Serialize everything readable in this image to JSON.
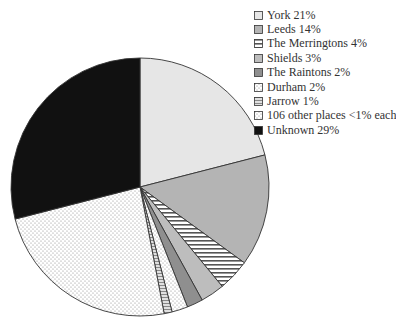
{
  "chart_data": {
    "type": "pie",
    "title": "",
    "start_angle_deg": 0,
    "direction": "clockwise",
    "slices": [
      {
        "label": "York",
        "value": 21,
        "legend": "York 21%",
        "fill": "#e6e6e6",
        "pattern": "solid"
      },
      {
        "label": "Leeds",
        "value": 14,
        "legend": "Leeds 14%",
        "fill": "#b4b4b4",
        "pattern": "solid"
      },
      {
        "label": "The Merringtons",
        "value": 4,
        "legend": "The Merringtons 4%",
        "fill": "#ffffff",
        "pattern": "hstripes"
      },
      {
        "label": "Shields",
        "value": 3,
        "legend": "Shields 3%",
        "fill": "#bdbdbd",
        "pattern": "solid"
      },
      {
        "label": "The Raintons",
        "value": 2,
        "legend": "The Raintons 2%",
        "fill": "#8f8f8f",
        "pattern": "solid"
      },
      {
        "label": "Durham",
        "value": 2,
        "legend": "Durham 2%",
        "fill": "#f2f2f2",
        "pattern": "dots"
      },
      {
        "label": "Jarrow",
        "value": 1,
        "legend": "Jarrow 1%",
        "fill": "#d9d9d9",
        "pattern": "hstripes-gray"
      },
      {
        "label": "106 other places <1% each",
        "value": 24,
        "legend": "106 other places <1% each",
        "fill": "#ffffff",
        "pattern": "dots"
      },
      {
        "label": "Unknown",
        "value": 29,
        "legend": "Unknown 29%",
        "fill": "#111111",
        "pattern": "solid"
      }
    ],
    "legend_position": "top-right",
    "grid": false
  }
}
